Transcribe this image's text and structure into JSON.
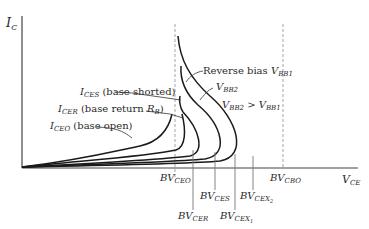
{
  "diagram": {
    "axes": {
      "y_label_main": "I",
      "y_label_sub": "C",
      "x_label_main": "V",
      "x_label_sub": "CE"
    },
    "curves": [
      {
        "id": "ICEO",
        "label_main": "I",
        "label_sub": "CEO",
        "label_text": " (base open)"
      },
      {
        "id": "ICER",
        "label_main": "I",
        "label_sub": "CER",
        "label_text": " (base return ",
        "label_extra_main": "R",
        "label_extra_sub": "B",
        "label_close": ")"
      },
      {
        "id": "ICES",
        "label_main": "I",
        "label_sub": "CES",
        "label_text": " (base shorted)"
      },
      {
        "id": "VBB2",
        "label_main": "V",
        "label_sub": "BB2"
      },
      {
        "id": "VBB1",
        "label_prefix": "Reverse bias ",
        "label_main": "V",
        "label_sub": "BB1"
      }
    ],
    "relation": {
      "left_main": "V",
      "left_sub": "BB2",
      "op": " > ",
      "right_main": "V",
      "right_sub": "BB1"
    },
    "breakdown_labels": [
      {
        "id": "BVCEO",
        "prefix": "BV",
        "sub": "CEO"
      },
      {
        "id": "BVCER",
        "prefix": "BV",
        "sub": "CER"
      },
      {
        "id": "BVCES",
        "prefix": "BV",
        "sub": "CES"
      },
      {
        "id": "BVCEX1",
        "prefix": "BV",
        "sub": "CEX",
        "subsub": "1"
      },
      {
        "id": "BVCEX2",
        "prefix": "BV",
        "sub": "CEX",
        "subsub": "2"
      },
      {
        "id": "BVCBO",
        "prefix": "BV",
        "sub": "CBO"
      }
    ],
    "colors": {
      "line": "#1a1a1a",
      "dashed": "#9a9a9a",
      "text": "#2a2a2a"
    }
  }
}
